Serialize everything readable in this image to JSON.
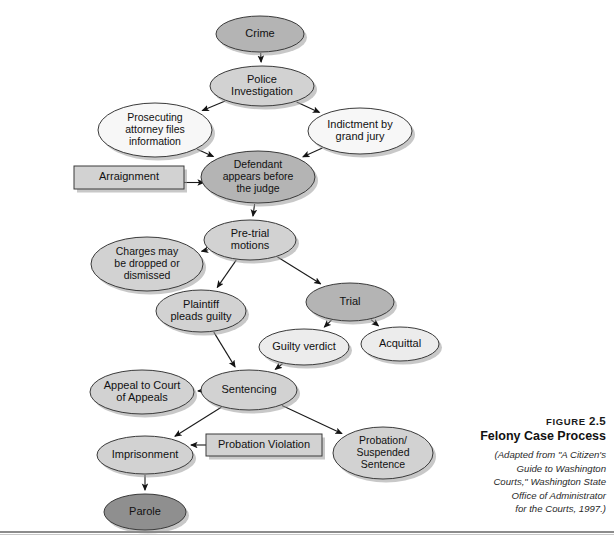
{
  "figure": {
    "number_prefix": "Figure",
    "number": "2.5",
    "title": "Felony Case Process",
    "source_lines": [
      "(Adapted from \"A Citizen's",
      "Guide to Washington",
      "Courts,\" Washington State",
      "Office of Administrator",
      "for the Courts, 1997.)"
    ]
  },
  "colors": {
    "fill_dark": "#8f8f8f",
    "fill_medium": "#b4b4b4",
    "fill_light": "#d2d2d2",
    "fill_pale": "#ececec",
    "fill_white": "#f7f7f7",
    "stroke": "#3a3a3a",
    "shadow": "#9a9a9a",
    "arrow": "#1a1a1a",
    "rule": "#8c8c8c"
  },
  "chart_data": {
    "type": "diagram",
    "title": "Felony Case Process",
    "nodes": [
      {
        "id": "crime",
        "label": "Crime",
        "shape": "ellipse",
        "fill": "medium",
        "cx": 260,
        "cy": 34,
        "rx": 44,
        "ry": 18,
        "lines": [
          "Crime"
        ]
      },
      {
        "id": "police",
        "label": "Police Investigation",
        "shape": "ellipse",
        "fill": "light",
        "cx": 262,
        "cy": 86,
        "rx": 52,
        "ry": 20,
        "lines": [
          "Police",
          "Investigation"
        ]
      },
      {
        "id": "prosecuting",
        "label": "Prosecuting attorney files information",
        "shape": "ellipse",
        "fill": "white",
        "cx": 155,
        "cy": 130,
        "rx": 57,
        "ry": 27,
        "lines": [
          "Prosecuting",
          "attorney files",
          "information"
        ]
      },
      {
        "id": "indictment",
        "label": "Indictment by grand jury",
        "shape": "ellipse",
        "fill": "white",
        "cx": 360,
        "cy": 131,
        "rx": 52,
        "ry": 23,
        "lines": [
          "Indictment by",
          "grand jury"
        ]
      },
      {
        "id": "arraignment",
        "label": "Arraignment",
        "shape": "rect",
        "fill": "light",
        "x": 74,
        "y": 166,
        "w": 110,
        "h": 23,
        "lines": [
          "Arraignment"
        ]
      },
      {
        "id": "defendant",
        "label": "Defendant appears before the judge",
        "shape": "ellipse",
        "fill": "medium",
        "cx": 258,
        "cy": 177,
        "rx": 57,
        "ry": 26,
        "lines": [
          "Defendant",
          "appears before",
          "the judge"
        ]
      },
      {
        "id": "pretrial",
        "label": "Pre-trial motions",
        "shape": "ellipse",
        "fill": "light",
        "cx": 250,
        "cy": 240,
        "rx": 46,
        "ry": 20,
        "lines": [
          "Pre-trial",
          "motions"
        ]
      },
      {
        "id": "charges",
        "label": "Charges may be dropped or dismissed",
        "shape": "ellipse",
        "fill": "light",
        "cx": 147,
        "cy": 264,
        "rx": 56,
        "ry": 27,
        "lines": [
          "Charges may",
          "be dropped or",
          "dismissed"
        ]
      },
      {
        "id": "plaintiff",
        "label": "Plaintiff pleads guilty",
        "shape": "ellipse",
        "fill": "light",
        "cx": 201,
        "cy": 311,
        "rx": 45,
        "ry": 21,
        "lines": [
          "Plaintiff",
          "pleads guilty"
        ]
      },
      {
        "id": "trial",
        "label": "Trial",
        "shape": "ellipse",
        "fill": "medium",
        "cx": 350,
        "cy": 302,
        "rx": 44,
        "ry": 19,
        "lines": [
          "Trial"
        ]
      },
      {
        "id": "guilty",
        "label": "Guilty verdict",
        "shape": "ellipse",
        "fill": "pale",
        "cx": 304,
        "cy": 347,
        "rx": 45,
        "ry": 18,
        "lines": [
          "Guilty verdict"
        ]
      },
      {
        "id": "acquittal",
        "label": "Acquittal",
        "shape": "ellipse",
        "fill": "pale",
        "cx": 400,
        "cy": 344,
        "rx": 39,
        "ry": 17,
        "lines": [
          "Acquittal"
        ]
      },
      {
        "id": "appeal",
        "label": "Appeal to Court of Appeals",
        "shape": "ellipse",
        "fill": "light",
        "cx": 142,
        "cy": 392,
        "rx": 52,
        "ry": 22,
        "lines": [
          "Appeal to Court",
          "of Appeals"
        ]
      },
      {
        "id": "sentencing",
        "label": "Sentencing",
        "shape": "ellipse",
        "fill": "light",
        "cx": 249,
        "cy": 390,
        "rx": 48,
        "ry": 20,
        "lines": [
          "Sentencing"
        ]
      },
      {
        "id": "probation_violation",
        "label": "Probation Violation",
        "shape": "rect",
        "fill": "light",
        "x": 206,
        "y": 434,
        "w": 116,
        "h": 22,
        "lines": [
          "Probation Violation"
        ]
      },
      {
        "id": "imprisonment",
        "label": "Imprisonment",
        "shape": "ellipse",
        "fill": "light",
        "cx": 145,
        "cy": 455,
        "rx": 48,
        "ry": 19,
        "lines": [
          "Imprisonment"
        ]
      },
      {
        "id": "probation",
        "label": "Probation/ Suspended Sentence",
        "shape": "ellipse",
        "fill": "light",
        "cx": 383,
        "cy": 453,
        "rx": 50,
        "ry": 26,
        "lines": [
          "Probation/",
          "Suspended",
          "Sentence"
        ]
      },
      {
        "id": "parole",
        "label": "Parole",
        "shape": "ellipse",
        "fill": "dark",
        "cx": 145,
        "cy": 512,
        "rx": 41,
        "ry": 18,
        "lines": [
          "Parole"
        ]
      }
    ],
    "edges": [
      {
        "from": "crime",
        "to": "police"
      },
      {
        "from": "police",
        "to": "prosecuting"
      },
      {
        "from": "police",
        "to": "indictment"
      },
      {
        "from": "prosecuting",
        "to": "defendant"
      },
      {
        "from": "indictment",
        "to": "defendant"
      },
      {
        "from": "arraignment",
        "to": "defendant"
      },
      {
        "from": "defendant",
        "to": "pretrial"
      },
      {
        "from": "pretrial",
        "to": "charges"
      },
      {
        "from": "pretrial",
        "to": "plaintiff"
      },
      {
        "from": "pretrial",
        "to": "trial"
      },
      {
        "from": "trial",
        "to": "guilty"
      },
      {
        "from": "trial",
        "to": "acquittal"
      },
      {
        "from": "plaintiff",
        "to": "sentencing"
      },
      {
        "from": "guilty",
        "to": "sentencing"
      },
      {
        "from": "sentencing",
        "to": "appeal"
      },
      {
        "from": "sentencing",
        "to": "imprisonment"
      },
      {
        "from": "sentencing",
        "to": "probation"
      },
      {
        "from": "probation_violation",
        "to": "imprisonment"
      },
      {
        "from": "imprisonment",
        "to": "parole"
      }
    ]
  }
}
